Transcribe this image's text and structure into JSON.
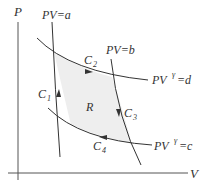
{
  "diagram": {
    "axes": {
      "y_label": "P",
      "x_label": "V"
    },
    "curves": [
      {
        "id": "C1",
        "label": "C",
        "subscript": "1",
        "equation": "PV=a",
        "type": "isotherm",
        "direction": "up"
      },
      {
        "id": "C2",
        "label": "C",
        "subscript": "2",
        "equation_base": "PV",
        "equation_exp": "γ",
        "equation_rest": "=d",
        "type": "adiabat",
        "direction": "right"
      },
      {
        "id": "C3",
        "label": "C",
        "subscript": "3",
        "equation": "PV=b",
        "type": "isotherm",
        "direction": "down"
      },
      {
        "id": "C4",
        "label": "C",
        "subscript": "4",
        "equation_base": "PV",
        "equation_exp": "γ",
        "equation_rest": "=c",
        "type": "adiabat",
        "direction": "left"
      }
    ],
    "region_label": "R",
    "colors": {
      "line": "#333333",
      "region_fill": "#eeeeee",
      "axis": "#555555"
    }
  }
}
